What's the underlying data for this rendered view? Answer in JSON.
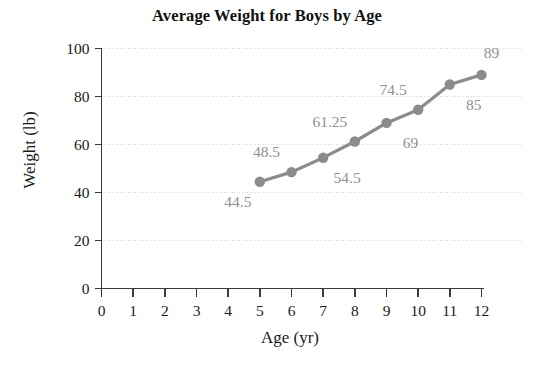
{
  "chart_data": {
    "type": "line",
    "title": "Average Weight for Boys by Age",
    "xlabel": "Age (yr)",
    "ylabel": "Weight (lb)",
    "x": [
      5,
      6,
      7,
      8,
      9,
      10,
      11,
      12
    ],
    "values": [
      44.5,
      48.5,
      54.5,
      61.25,
      69,
      74.5,
      85,
      89
    ],
    "point_labels": [
      "44.5",
      "48.5",
      "54.5",
      "61.25",
      "69",
      "74.5",
      "85",
      "89"
    ],
    "label_positions": [
      "below-left",
      "above-left",
      "below-right",
      "above-left",
      "below-right",
      "above-left",
      "below-right",
      "above-right"
    ],
    "xlim": [
      0,
      12
    ],
    "ylim": [
      0,
      100
    ],
    "xticks": [
      0,
      1,
      2,
      3,
      4,
      5,
      6,
      7,
      8,
      9,
      10,
      11,
      12
    ],
    "xtick_labels": [
      "0",
      "1",
      "2",
      "3",
      "4",
      "5",
      "6",
      "7",
      "8",
      "9",
      "10",
      "11",
      "12"
    ],
    "yticks": [
      0,
      20,
      40,
      60,
      80,
      100
    ],
    "ytick_labels": [
      "0",
      "20",
      "40",
      "60",
      "80",
      "100"
    ],
    "grid": "horizontal-dotted",
    "legend": "none",
    "series_color": "#8c8c8c",
    "marker": "circle",
    "axis_color": "#3a3a3a",
    "grid_color": "#d8d8d8",
    "label_color": "#909090"
  }
}
